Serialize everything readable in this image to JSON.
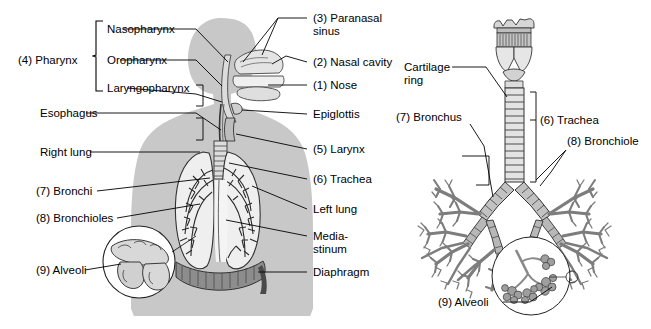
{
  "figure": {
    "title_hidden": "Respiratory system anatomy diagram",
    "background_color": "#ffffff",
    "ink_color": "#000000",
    "silhouette_color": "#c8c8c8",
    "organ_fill": "#e9e9e9",
    "tree_fill": "#9a9a9a"
  },
  "left_panel": {
    "name": "human-torso-respiratory-diagram",
    "bracket_group_label": "(4) Pharynx",
    "bracket_items": [
      {
        "label": "Nasopharynx"
      },
      {
        "label": "Oropharynx"
      },
      {
        "label": "Laryngopharynx"
      }
    ],
    "left_labels": [
      {
        "id": "pharynx",
        "text": "(4) Pharynx"
      },
      {
        "id": "nasopharynx",
        "text": "Nasopharynx"
      },
      {
        "id": "oropharynx",
        "text": "Oropharynx"
      },
      {
        "id": "laryngopharynx",
        "text": "Laryngopharynx"
      },
      {
        "id": "esophagus",
        "text": "Esophagus"
      },
      {
        "id": "right-lung",
        "text": "Right lung"
      },
      {
        "id": "bronchi",
        "text": "(7) Bronchi"
      },
      {
        "id": "bronchioles",
        "text": "(8) Bronchioles"
      },
      {
        "id": "alveoli",
        "text": "(9) Alveoli"
      }
    ],
    "right_labels": [
      {
        "id": "paranasal-sinus-line1",
        "text": "(3) Paranasal"
      },
      {
        "id": "paranasal-sinus-line2",
        "text": "sinus"
      },
      {
        "id": "nasal-cavity",
        "text": "(2) Nasal cavity"
      },
      {
        "id": "nose",
        "text": "(1) Nose"
      },
      {
        "id": "epiglottis",
        "text": "Epiglottis"
      },
      {
        "id": "larynx",
        "text": "(5) Larynx"
      },
      {
        "id": "trachea",
        "text": "(6) Trachea"
      },
      {
        "id": "left-lung",
        "text": "Left lung"
      },
      {
        "id": "mediastinum-line1",
        "text": "Media-"
      },
      {
        "id": "mediastinum-line2",
        "text": "stinum"
      },
      {
        "id": "diaphragm",
        "text": "Diaphragm"
      }
    ]
  },
  "right_panel": {
    "name": "bronchial-tree-diagram",
    "labels": [
      {
        "id": "cartilage-ring-line1",
        "text": "Cartilage"
      },
      {
        "id": "cartilage-ring-line2",
        "text": "ring"
      },
      {
        "id": "bronchus",
        "text": "(7) Bronchus"
      },
      {
        "id": "trachea",
        "text": "(6) Trachea"
      },
      {
        "id": "bronchiole",
        "text": "(8) Bronchiole"
      },
      {
        "id": "alveoli",
        "text": "(9) Alveoli"
      }
    ]
  }
}
